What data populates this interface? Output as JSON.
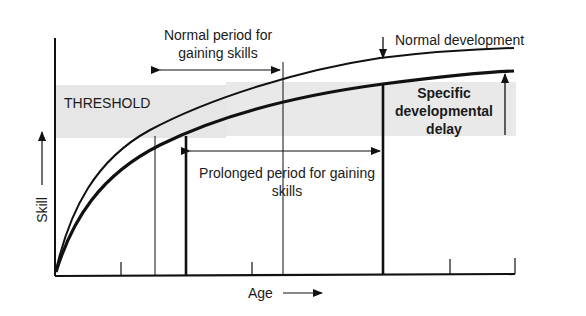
{
  "diagram": {
    "threshold_label": "THRESHOLD",
    "normal_period": {
      "line1": "Normal period for",
      "line2": "gaining skills"
    },
    "normal_development_label": "Normal development",
    "specific_delay": {
      "line1": "Specific",
      "line2": "developmental",
      "line3": "delay"
    },
    "prolonged_period": {
      "line1": "Prolonged period for gaining",
      "line2": "skills"
    },
    "x_axis_label": "Age",
    "y_axis_label": "Skill",
    "curves": [
      {
        "name": "Normal development",
        "style": "thin"
      },
      {
        "name": "Delayed development",
        "style": "thick"
      }
    ],
    "colors": {
      "threshold_band": "#e6e6e6",
      "ink": "#111111"
    }
  }
}
